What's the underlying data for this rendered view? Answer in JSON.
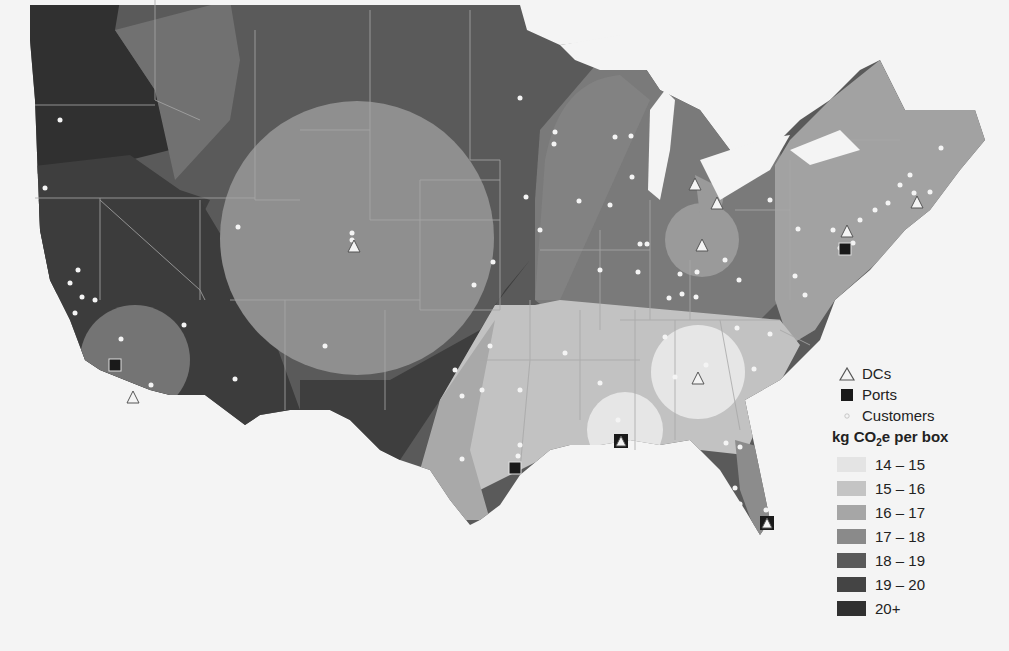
{
  "map": {
    "title": "kg CO2e per box by region, contiguous United States",
    "background": "#f4f4f4",
    "state_border_color": "#9a9a9a",
    "customer_color": "#f4f4f4"
  },
  "legend": {
    "symbols": [
      {
        "name": "dcs",
        "label": "DCs",
        "icon": "triangle-outline-icon"
      },
      {
        "name": "ports",
        "label": "Ports",
        "icon": "filled-square-icon"
      },
      {
        "name": "customers",
        "label": "Customers",
        "icon": "small-dot-icon"
      }
    ],
    "scale_title_prefix": "kg CO",
    "scale_title_sub": "2",
    "scale_title_suffix": "e per box",
    "bins": [
      {
        "label": "14 – 15",
        "color": "#e4e4e4"
      },
      {
        "label": "15 – 16",
        "color": "#c4c4c4"
      },
      {
        "label": "16 – 17",
        "color": "#a6a6a6"
      },
      {
        "label": "17 – 18",
        "color": "#8a8a8a"
      },
      {
        "label": "18 – 19",
        "color": "#5a5a5a"
      },
      {
        "label": "19 – 20",
        "color": "#444444"
      },
      {
        "label": "20+",
        "color": "#303030"
      }
    ]
  },
  "dcs": [
    {
      "region": "Denver CO",
      "x": 354,
      "y": 246
    },
    {
      "region": "Southern California",
      "x": 133,
      "y": 397
    },
    {
      "region": "Michigan",
      "x": 695,
      "y": 184
    },
    {
      "region": "Toledo OH",
      "x": 717,
      "y": 203
    },
    {
      "region": "Columbus OH",
      "x": 702,
      "y": 245
    },
    {
      "region": "Pennsylvania / NJ",
      "x": 847,
      "y": 231
    },
    {
      "region": "Boston MA",
      "x": 917,
      "y": 202
    },
    {
      "region": "Atlanta GA",
      "x": 698,
      "y": 378
    },
    {
      "region": "New Orleans LA",
      "x": 621,
      "y": 441
    },
    {
      "region": "Miami FL",
      "x": 767,
      "y": 523
    }
  ],
  "ports": [
    {
      "region": "Los Angeles CA",
      "x": 115,
      "y": 365
    },
    {
      "region": "Houston TX",
      "x": 515,
      "y": 468
    },
    {
      "region": "New York / NJ",
      "x": 845,
      "y": 249
    },
    {
      "region": "New Orleans LA",
      "x": 621,
      "y": 441
    },
    {
      "region": "Miami FL",
      "x": 767,
      "y": 523
    }
  ]
}
